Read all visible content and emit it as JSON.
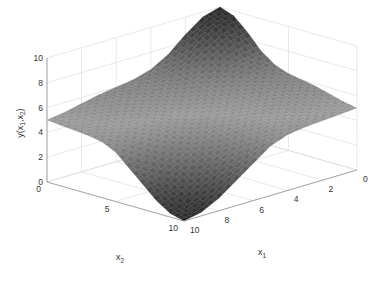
{
  "chart_data": {
    "type": "surface",
    "title": "",
    "xlabel": "x1",
    "ylabel": "x2",
    "zlabel": "y(x1,x2)",
    "x1_range": [
      0,
      10
    ],
    "x2_range": [
      0,
      10
    ],
    "z_range": [
      0,
      10
    ],
    "x1_ticks": [
      "0",
      "2",
      "4",
      "6",
      "8",
      "10"
    ],
    "x2_ticks": [
      "0",
      "5",
      "10"
    ],
    "z_ticks": [
      "0",
      "2",
      "4",
      "6",
      "8",
      "10"
    ],
    "grid": true,
    "colormap": "grayscale",
    "corner_values": [
      {
        "x1": 0,
        "x2": 0,
        "z": 10
      },
      {
        "x1": 0,
        "x2": 10,
        "z": 5
      },
      {
        "x1": 10,
        "x2": 0,
        "z": 5
      },
      {
        "x1": 10,
        "x2": 10,
        "z": 0
      }
    ],
    "surface_grid": {
      "x1": [
        0,
        1,
        2,
        3,
        4,
        5,
        6,
        7,
        8,
        9,
        10
      ],
      "x2": [
        0,
        1,
        2,
        3,
        4,
        5,
        6,
        7,
        8,
        9,
        10
      ],
      "z": [
        [
          10.0,
          9.6,
          8.6,
          7.4,
          6.6,
          6.2,
          6.0,
          5.8,
          5.5,
          5.2,
          5.0
        ],
        [
          9.6,
          9.2,
          8.3,
          7.2,
          6.5,
          6.1,
          5.9,
          5.7,
          5.4,
          5.1,
          4.9
        ],
        [
          8.6,
          8.3,
          7.6,
          6.8,
          6.2,
          5.9,
          5.7,
          5.5,
          5.3,
          5.0,
          4.8
        ],
        [
          7.4,
          7.2,
          6.8,
          6.3,
          5.9,
          5.6,
          5.4,
          5.3,
          5.1,
          4.9,
          4.7
        ],
        [
          6.6,
          6.5,
          6.2,
          5.9,
          5.6,
          5.3,
          5.1,
          5.0,
          4.9,
          4.7,
          4.5
        ],
        [
          6.2,
          6.1,
          5.9,
          5.6,
          5.3,
          5.0,
          4.8,
          4.6,
          4.4,
          4.2,
          4.0
        ],
        [
          6.0,
          5.9,
          5.7,
          5.4,
          5.1,
          4.8,
          4.4,
          4.0,
          3.6,
          3.3,
          3.0
        ],
        [
          5.8,
          5.7,
          5.5,
          5.3,
          5.0,
          4.6,
          4.0,
          3.4,
          2.8,
          2.3,
          2.0
        ],
        [
          5.5,
          5.4,
          5.3,
          5.1,
          4.9,
          4.4,
          3.6,
          2.8,
          2.0,
          1.4,
          1.0
        ],
        [
          5.2,
          5.1,
          5.0,
          4.9,
          4.7,
          4.2,
          3.3,
          2.3,
          1.4,
          0.6,
          0.3
        ],
        [
          5.0,
          4.9,
          4.8,
          4.7,
          4.5,
          4.0,
          3.0,
          2.0,
          1.0,
          0.3,
          0.0
        ]
      ]
    }
  }
}
